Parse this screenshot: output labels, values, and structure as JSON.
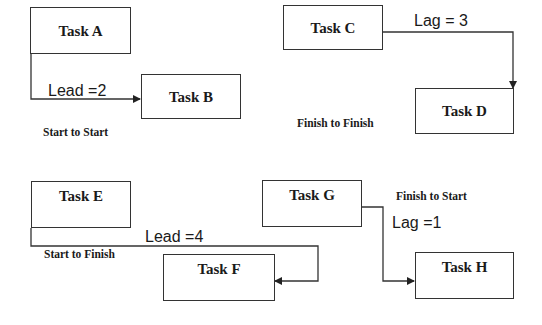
{
  "diagram": {
    "type": "task-dependency-relationships",
    "colors": {
      "background": "#ffffff",
      "stroke": "#333333",
      "text": "#1a1a1a"
    },
    "tasks": {
      "a": "Task A",
      "b": "Task B",
      "c": "Task C",
      "d": "Task D",
      "e": "Task E",
      "f": "Task F",
      "g": "Task G",
      "h": "Task H"
    },
    "relationships": [
      {
        "from": "Task A",
        "to": "Task B",
        "type": "Start to Start",
        "offset": "Lead =2"
      },
      {
        "from": "Task C",
        "to": "Task D",
        "type": "Finish to Finish",
        "offset": "Lag = 3"
      },
      {
        "from": "Task E",
        "to": "Task F",
        "type": "Start to Finish",
        "offset": "Lead =4"
      },
      {
        "from": "Task G",
        "to": "Task H",
        "type": "Finish to Start",
        "offset": "Lag =1"
      }
    ]
  }
}
